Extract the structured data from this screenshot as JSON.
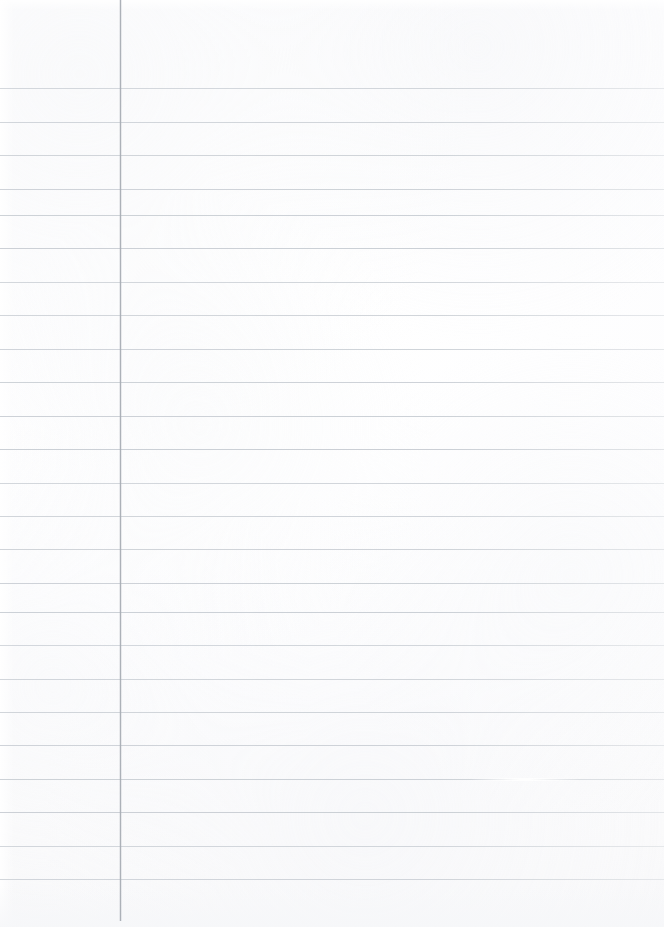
{
  "document": {
    "kind": "scanned-lined-notebook-paper",
    "title": "Blank ruled notebook page",
    "content_text": "",
    "width_px": 664,
    "height_px": 927
  },
  "paper": {
    "background_color": "#fdfdfd",
    "has_visible_text": false,
    "note": "blank page - no handwriting or printed content"
  },
  "ruling": {
    "line_color": "#c9ced4",
    "line_thickness_px": 1,
    "first_line_y": 88,
    "spacing_px": 33.5,
    "line_count": 24,
    "line_y_positions": [
      88,
      121.5,
      155,
      188.5,
      215,
      248,
      281.5,
      315,
      348.5,
      382,
      415.5,
      449,
      482.5,
      516,
      549,
      582.5,
      612,
      645,
      678.5,
      712,
      745,
      778.5,
      812,
      845.5,
      879
    ],
    "artifact_line_index": 21,
    "artifact_gap_left_px": 470,
    "artifact_gap_width_px": 110
  },
  "margin_rule": {
    "orientation": "vertical",
    "color": "#a9aeb5",
    "x_position_px": 120,
    "top_y": 0,
    "bottom_y": 921,
    "thickness_px": 1
  }
}
